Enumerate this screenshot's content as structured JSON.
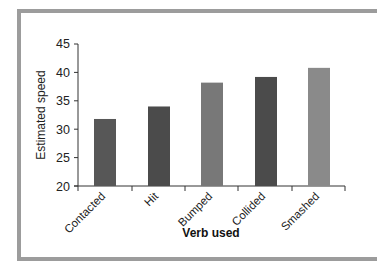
{
  "chart_data": {
    "type": "bar",
    "title": "",
    "xlabel": "Verb used",
    "ylabel": "Estimated speed",
    "categories": [
      "Contacted",
      "Hit",
      "Bumped",
      "Collided",
      "Smashed"
    ],
    "values": [
      31.8,
      34.0,
      38.2,
      39.2,
      40.8
    ],
    "colors": [
      "#575757",
      "#4b4b4b",
      "#787878",
      "#4b4b4b",
      "#8a8a8a"
    ],
    "ylim": [
      20,
      45
    ],
    "yticks": [
      20,
      25,
      30,
      35,
      40,
      45
    ],
    "grid": false,
    "legend": null
  },
  "labels": {
    "xlabel": "Verb used",
    "ylabel": "Estimated speed",
    "yticks": [
      "20",
      "25",
      "30",
      "35",
      "40",
      "45"
    ],
    "categories": [
      "Contacted",
      "Hit",
      "Bumped",
      "Collided",
      "Smashed"
    ]
  }
}
